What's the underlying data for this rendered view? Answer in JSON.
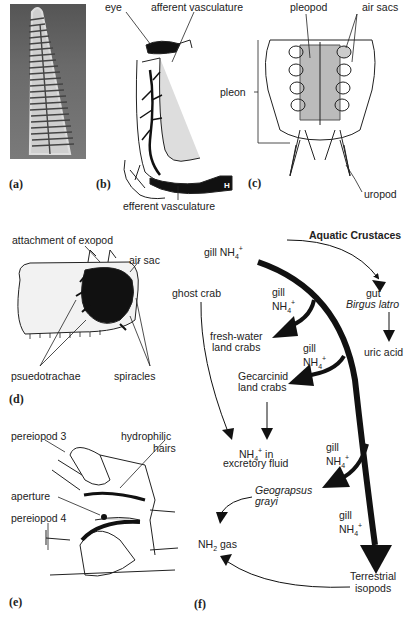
{
  "panels": {
    "a": {
      "label": "(a)"
    },
    "b": {
      "label": "(b)",
      "eye": "eye",
      "afferent": "afferent vasculature",
      "efferent": "efferent vasculature",
      "h_marker": "H"
    },
    "c": {
      "label": "(c)",
      "pleopod": "pleopod",
      "air_sacs": "air sacs",
      "pleon": "pleon",
      "uropod": "uropod"
    },
    "d": {
      "label": "(d)",
      "attachment": "attachment of exopod",
      "air_sac": "air sac",
      "pseudotrachae": "psuedotrachae",
      "spiracles": "spiracles"
    },
    "e": {
      "label": "(e)",
      "pereiopod3": "pereiopod 3",
      "hydrophilic_1": "hydrophilic",
      "hydrophilic_2": "hairs",
      "aperture": "aperture",
      "pereiopod4": "pereiopod 4"
    },
    "f": {
      "label": "(f)",
      "aquatic": "Aquatic Crustaces",
      "gill_top": "gill NH",
      "gut": "gut",
      "birgus": "Birgus latro",
      "uric": "uric acid",
      "ghost": "ghost crab",
      "gill1_a": "gill",
      "gill1_b": "NH",
      "fresh1": "fresh-water",
      "fresh2": "land crabs",
      "gill2_a": "gill",
      "gill2_b": "NH",
      "gecar1": "Gecarcinid",
      "gecar2": "land crabs",
      "nh4_in": "NH",
      "nh4_in_suffix": " in",
      "excretory": "excretory fluid",
      "gill3_a": "gill",
      "gill3_b": "NH",
      "geo1": "Geograpsus",
      "geo2": "grayi",
      "gill4_a": "gill",
      "gill4_b": "NH",
      "nh2": "NH",
      "nh2_suffix": " gas",
      "terr1": "Terrestrial",
      "terr2": "isopods",
      "sub4": "4",
      "sub2": "2",
      "sup": "+"
    }
  }
}
